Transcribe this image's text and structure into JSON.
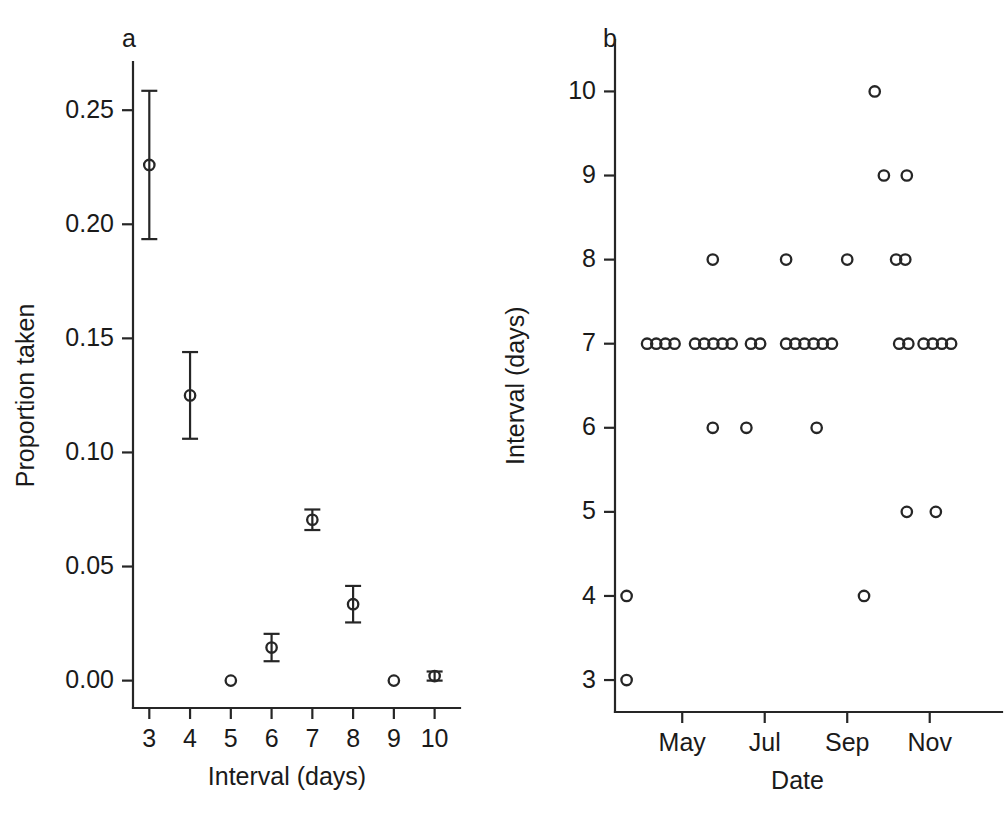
{
  "figure": {
    "background": "#ffffff",
    "ink_color": "#262626",
    "panels": [
      "a",
      "b"
    ]
  },
  "panel_a": {
    "label": "a",
    "xlabel": "Interval (days)",
    "ylabel": "Proportion taken",
    "xticks": [
      "3",
      "4",
      "5",
      "6",
      "7",
      "8",
      "9",
      "10"
    ],
    "yticks": [
      "0.00",
      "0.05",
      "0.10",
      "0.15",
      "0.20",
      "0.25"
    ]
  },
  "panel_b": {
    "label": "b",
    "xlabel": "Date",
    "ylabel": "Interval (days)",
    "xticks": [
      "May",
      "Jul",
      "Sep",
      "Nov"
    ],
    "yticks": [
      "3",
      "4",
      "5",
      "6",
      "7",
      "8",
      "9",
      "10"
    ]
  },
  "chart_data": [
    {
      "type": "scatter",
      "panel": "a",
      "title": "a",
      "xlabel": "Interval (days)",
      "ylabel": "Proportion taken",
      "xlim": [
        2.6,
        10.5
      ],
      "ylim": [
        -0.012,
        0.272
      ],
      "xticks": [
        3,
        4,
        5,
        6,
        7,
        8,
        9,
        10
      ],
      "xticklabels": [
        "3",
        "4",
        "5",
        "6",
        "7",
        "8",
        "9",
        "10"
      ],
      "yticks": [
        0.0,
        0.05,
        0.1,
        0.15,
        0.2,
        0.25
      ],
      "yticklabels": [
        "0.00",
        "0.05",
        "0.10",
        "0.15",
        "0.20",
        "0.25"
      ],
      "grid": false,
      "legend": null,
      "errorbars": true,
      "x": [
        3,
        4,
        5,
        6,
        7,
        8,
        9,
        10
      ],
      "values": [
        0.226,
        0.125,
        0.0,
        0.0145,
        0.0705,
        0.0335,
        0.0,
        0.002
      ],
      "err_low": [
        0.0325,
        0.019,
        0.0,
        0.006,
        0.0045,
        0.008,
        0.0,
        0.002
      ],
      "err_high": [
        0.0325,
        0.019,
        0.0,
        0.006,
        0.0045,
        0.008,
        0.0,
        0.002
      ]
    },
    {
      "type": "scatter",
      "panel": "b",
      "title": "b",
      "xlabel": "Date",
      "ylabel": "Interval (days)",
      "xlim": [
        0,
        12.6
      ],
      "ylim": [
        2.62,
        10.35
      ],
      "xticks": [
        2.2,
        4.9,
        7.6,
        10.3
      ],
      "xticklabels": [
        "May",
        "Jul",
        "Sep",
        "Nov"
      ],
      "yticks": [
        3,
        4,
        5,
        6,
        7,
        8,
        9,
        10
      ],
      "yticklabels": [
        "3",
        "4",
        "5",
        "6",
        "7",
        "8",
        "9",
        "10"
      ],
      "grid": false,
      "legend": null,
      "errorbars": false,
      "points": [
        {
          "x": 0.38,
          "y": 3
        },
        {
          "x": 0.38,
          "y": 4
        },
        {
          "x": 8.15,
          "y": 4
        },
        {
          "x": 9.55,
          "y": 5
        },
        {
          "x": 10.5,
          "y": 5
        },
        {
          "x": 3.2,
          "y": 6
        },
        {
          "x": 4.3,
          "y": 6
        },
        {
          "x": 6.6,
          "y": 6
        },
        {
          "x": 1.05,
          "y": 7
        },
        {
          "x": 1.35,
          "y": 7
        },
        {
          "x": 1.65,
          "y": 7
        },
        {
          "x": 1.95,
          "y": 7
        },
        {
          "x": 2.62,
          "y": 7
        },
        {
          "x": 2.92,
          "y": 7
        },
        {
          "x": 3.22,
          "y": 7
        },
        {
          "x": 3.52,
          "y": 7
        },
        {
          "x": 3.82,
          "y": 7
        },
        {
          "x": 4.45,
          "y": 7
        },
        {
          "x": 4.75,
          "y": 7
        },
        {
          "x": 5.6,
          "y": 7
        },
        {
          "x": 5.9,
          "y": 7
        },
        {
          "x": 6.2,
          "y": 7
        },
        {
          "x": 6.5,
          "y": 7
        },
        {
          "x": 6.8,
          "y": 7
        },
        {
          "x": 7.1,
          "y": 7
        },
        {
          "x": 9.3,
          "y": 7
        },
        {
          "x": 9.6,
          "y": 7
        },
        {
          "x": 10.1,
          "y": 7
        },
        {
          "x": 10.4,
          "y": 7
        },
        {
          "x": 10.7,
          "y": 7
        },
        {
          "x": 11.0,
          "y": 7
        },
        {
          "x": 3.2,
          "y": 8
        },
        {
          "x": 5.6,
          "y": 8
        },
        {
          "x": 7.6,
          "y": 8
        },
        {
          "x": 9.2,
          "y": 8
        },
        {
          "x": 9.5,
          "y": 8
        },
        {
          "x": 8.8,
          "y": 9
        },
        {
          "x": 9.55,
          "y": 9
        },
        {
          "x": 8.5,
          "y": 10
        }
      ]
    }
  ]
}
